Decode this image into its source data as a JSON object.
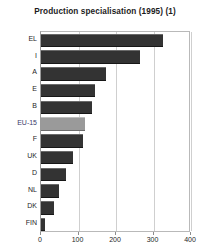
{
  "chart_data": {
    "type": "bar",
    "orientation": "horizontal",
    "title": "Production specialisation (1995) (1)",
    "xlabel": "",
    "ylabel": "",
    "categories": [
      "EL",
      "I",
      "A",
      "E",
      "B",
      "EU-15",
      "F",
      "UK",
      "D",
      "NL",
      "DK",
      "FIN"
    ],
    "values": [
      325,
      264,
      172,
      144,
      136,
      117,
      112,
      85,
      67,
      48,
      35,
      11
    ],
    "highlight_category": "EU-15",
    "xlim": [
      0,
      400
    ],
    "xticks": [
      0,
      100,
      200,
      300,
      400
    ],
    "xtick_labels": [
      "0",
      "100",
      "200",
      "300",
      "400"
    ],
    "grid": true,
    "grid_axis": "x",
    "legend": null,
    "colors": {
      "bar": "#333333",
      "bar_highlight": "#9a9a9a",
      "grid": "#cfcfcf",
      "axis": "#9a9a9a",
      "text": "#262626",
      "background": "#ffffff"
    }
  }
}
